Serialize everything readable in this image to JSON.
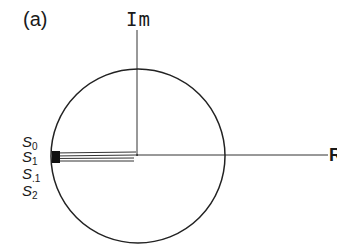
{
  "figure": {
    "panel_label": "(a)",
    "axes": {
      "vertical_label": "Im",
      "horizontal_label": "R"
    },
    "circle": {
      "center": [
        138,
        156
      ],
      "radius": 87,
      "stroke": "#222222"
    },
    "vectors": {
      "count": 4,
      "from": [
        138,
        156
      ],
      "to_x": 53,
      "y_offsets": [
        0,
        2.5,
        5,
        7.5
      ],
      "stroke": "#333333"
    },
    "state_labels": [
      {
        "base": "S",
        "sub": "0",
        "x": 22,
        "y": 134
      },
      {
        "base": "S",
        "sub": "1",
        "x": 22,
        "y": 149
      },
      {
        "base": "S",
        "sub": ".1",
        "x": 22,
        "y": 166
      },
      {
        "base": "S",
        "sub": "2",
        "x": 22,
        "y": 183
      }
    ],
    "colors": {
      "ink": "#1a1a1a",
      "background": "#ffffff"
    }
  }
}
